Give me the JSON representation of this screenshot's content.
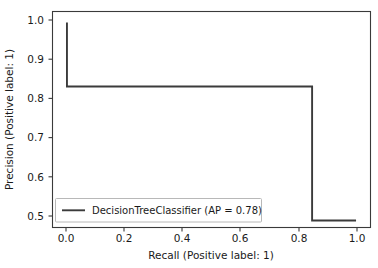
{
  "chart_data": {
    "type": "line",
    "title": "",
    "xlabel": "Recall (Positive label: 1)",
    "ylabel": "Precision (Positive label: 1)",
    "xlim": [
      -0.05,
      1.05
    ],
    "ylim": [
      0.472,
      1.028
    ],
    "xticks": [
      "0.0",
      "0.2",
      "0.4",
      "0.6",
      "0.8",
      "1.0"
    ],
    "xtick_values": [
      0.0,
      0.2,
      0.4,
      0.6,
      0.8,
      1.0
    ],
    "yticks": [
      "0.5",
      "0.6",
      "0.7",
      "0.8",
      "0.9",
      "1.0"
    ],
    "ytick_values": [
      0.5,
      0.6,
      0.7,
      0.8,
      0.9,
      1.0
    ],
    "grid": false,
    "legend_position": "lower left",
    "series": [
      {
        "name": "DecisionTreeClassifier (AP = 0.78)",
        "color": "#3b3b3b",
        "average_precision": 0.78,
        "x": [
          0.0,
          0.0,
          0.848,
          0.848,
          1.0
        ],
        "values": [
          1.0,
          0.835,
          0.835,
          0.49,
          0.49
        ]
      }
    ]
  },
  "legend": {
    "entries": [
      {
        "label": "DecisionTreeClassifier (AP = 0.78)"
      }
    ]
  }
}
